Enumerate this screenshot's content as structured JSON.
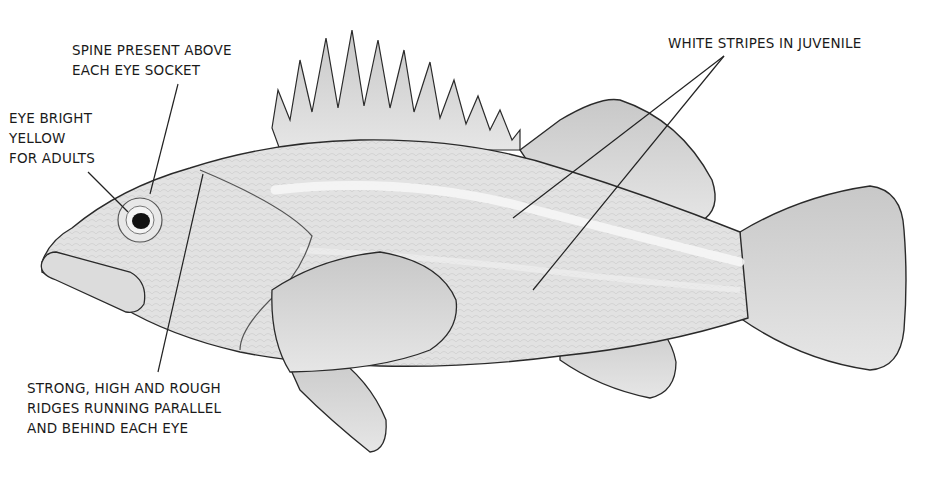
{
  "diagram": {
    "labels": {
      "spine": "SPINE PRESENT ABOVE\nEACH EYE SOCKET",
      "eye": "EYE BRIGHT\nYELLOW\nFOR ADULTS",
      "ridges": "STRONG, HIGH AND ROUGH\nRIDGES RUNNING PARALLEL\nAND BEHIND EACH EYE",
      "stripes": "WHITE STRIPES IN JUVENILE"
    },
    "colors": {
      "text": "#1a1a1a",
      "outline": "#2a2a2a",
      "body_fill": "#e4e4e4",
      "fin_fill": "#d6d6d6",
      "stripe": "#f4f4f4"
    }
  }
}
